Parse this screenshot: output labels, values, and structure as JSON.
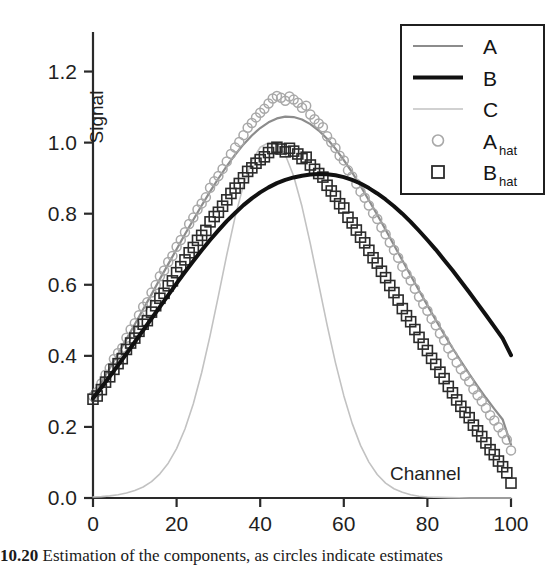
{
  "figure": {
    "caption_number": "10.20",
    "caption_text": "Estimation of the components, as circles indicate estimates"
  },
  "chart_data": {
    "type": "line",
    "title": "",
    "xlabel": "Channel",
    "ylabel": "Signal",
    "xlim": [
      0,
      100
    ],
    "ylim": [
      0,
      1.3
    ],
    "xticks": [
      "0",
      "20",
      "40",
      "60",
      "80",
      "100"
    ],
    "xtick_values": [
      0,
      20,
      40,
      60,
      80,
      100
    ],
    "yticks": [
      "0.0",
      "0.2",
      "0.4",
      "0.6",
      "0.8",
      "1.0",
      "1.2"
    ],
    "ytick_values": [
      0.0,
      0.2,
      0.4,
      0.6,
      0.8,
      1.0,
      1.2
    ],
    "grid": false,
    "legend_position": "top-right",
    "series": [
      {
        "name": "A",
        "label": "A",
        "kind": "line",
        "color": "#8c8c8c",
        "linewidth": 2.2,
        "x": [
          0,
          2,
          4,
          6,
          8,
          10,
          12,
          14,
          16,
          18,
          20,
          22,
          24,
          26,
          28,
          30,
          32,
          34,
          36,
          38,
          40,
          42,
          44,
          46,
          48,
          50,
          52,
          54,
          56,
          58,
          60,
          62,
          64,
          66,
          68,
          70,
          72,
          74,
          76,
          78,
          80,
          82,
          84,
          86,
          88,
          90,
          92,
          94,
          96,
          98,
          100
        ],
        "y": [
          0.285,
          0.325,
          0.365,
          0.405,
          0.447,
          0.489,
          0.531,
          0.573,
          0.616,
          0.658,
          0.7,
          0.742,
          0.783,
          0.823,
          0.862,
          0.899,
          0.934,
          0.966,
          0.995,
          1.02,
          1.041,
          1.057,
          1.068,
          1.073,
          1.072,
          1.065,
          1.052,
          1.034,
          1.011,
          0.983,
          0.951,
          0.916,
          0.878,
          0.838,
          0.797,
          0.755,
          0.712,
          0.669,
          0.626,
          0.584,
          0.542,
          0.501,
          0.461,
          0.422,
          0.385,
          0.349,
          0.315,
          0.282,
          0.251,
          0.221,
          0.15
        ]
      },
      {
        "name": "B",
        "label": "B",
        "kind": "line",
        "color": "#111111",
        "linewidth": 4.0,
        "x": [
          0,
          2,
          4,
          6,
          8,
          10,
          12,
          14,
          16,
          18,
          20,
          22,
          24,
          26,
          28,
          30,
          32,
          34,
          36,
          38,
          40,
          42,
          44,
          46,
          48,
          50,
          52,
          54,
          56,
          58,
          60,
          62,
          64,
          66,
          68,
          70,
          72,
          74,
          76,
          78,
          80,
          82,
          84,
          86,
          88,
          90,
          92,
          94,
          96,
          98,
          100
        ],
        "y": [
          0.28,
          0.311,
          0.342,
          0.374,
          0.406,
          0.439,
          0.472,
          0.505,
          0.538,
          0.571,
          0.604,
          0.636,
          0.667,
          0.697,
          0.726,
          0.753,
          0.779,
          0.802,
          0.824,
          0.843,
          0.86,
          0.874,
          0.886,
          0.895,
          0.902,
          0.907,
          0.91,
          0.912,
          0.911,
          0.908,
          0.903,
          0.895,
          0.885,
          0.872,
          0.857,
          0.84,
          0.821,
          0.8,
          0.777,
          0.752,
          0.726,
          0.699,
          0.67,
          0.641,
          0.61,
          0.579,
          0.547,
          0.515,
          0.482,
          0.449,
          0.402
        ]
      },
      {
        "name": "C",
        "label": "C",
        "kind": "line",
        "color": "#c2c2c2",
        "linewidth": 1.6,
        "x": [
          0,
          2,
          4,
          6,
          8,
          10,
          12,
          14,
          16,
          18,
          20,
          22,
          24,
          26,
          28,
          30,
          32,
          34,
          36,
          38,
          40,
          42,
          44,
          46,
          48,
          50,
          52,
          54,
          56,
          58,
          60,
          62,
          64,
          66,
          68,
          70,
          72,
          74,
          76,
          78,
          80,
          85,
          90,
          95,
          100
        ],
        "y": [
          0.003,
          0.004,
          0.006,
          0.009,
          0.014,
          0.021,
          0.031,
          0.046,
          0.068,
          0.098,
          0.139,
          0.194,
          0.265,
          0.353,
          0.456,
          0.569,
          0.684,
          0.791,
          0.881,
          0.948,
          0.987,
          1.0,
          0.996,
          0.966,
          0.906,
          0.82,
          0.715,
          0.601,
          0.487,
          0.381,
          0.288,
          0.21,
          0.148,
          0.101,
          0.066,
          0.042,
          0.026,
          0.016,
          0.009,
          0.005,
          0.003,
          0.001,
          0.0,
          0.0,
          0.0
        ]
      },
      {
        "name": "A_hat",
        "label": "A",
        "label_sub": "hat",
        "kind": "scatter",
        "marker": "circle",
        "color": "#a8a8a8",
        "markersize": 9,
        "x": [
          0,
          1,
          2,
          3,
          4,
          5,
          6,
          7,
          8,
          9,
          10,
          11,
          12,
          13,
          14,
          15,
          16,
          17,
          18,
          19,
          20,
          21,
          22,
          23,
          24,
          25,
          26,
          27,
          28,
          29,
          30,
          31,
          32,
          33,
          34,
          35,
          36,
          37,
          38,
          39,
          40,
          41,
          42,
          43,
          44,
          45,
          46,
          47,
          48,
          49,
          50,
          51,
          52,
          53,
          54,
          55,
          56,
          57,
          58,
          59,
          60,
          61,
          62,
          63,
          64,
          65,
          66,
          67,
          68,
          69,
          70,
          71,
          72,
          73,
          74,
          75,
          76,
          77,
          78,
          79,
          80,
          81,
          82,
          83,
          84,
          85,
          86,
          87,
          88,
          89,
          90,
          91,
          92,
          93,
          94,
          95,
          96,
          97,
          98,
          99,
          100
        ],
        "y": [
          0.286,
          0.298,
          0.322,
          0.347,
          0.366,
          0.391,
          0.408,
          0.422,
          0.451,
          0.474,
          0.492,
          0.514,
          0.538,
          0.551,
          0.578,
          0.599,
          0.624,
          0.64,
          0.664,
          0.681,
          0.707,
          0.726,
          0.748,
          0.771,
          0.789,
          0.812,
          0.829,
          0.846,
          0.873,
          0.891,
          0.906,
          0.926,
          0.947,
          0.968,
          0.986,
          1.002,
          1.021,
          1.042,
          1.055,
          1.071,
          1.084,
          1.095,
          1.11,
          1.124,
          1.131,
          1.126,
          1.118,
          1.13,
          1.121,
          1.112,
          1.098,
          1.104,
          1.079,
          1.066,
          1.054,
          1.043,
          1.018,
          1.001,
          0.985,
          0.963,
          0.95,
          0.922,
          0.905,
          0.884,
          0.862,
          0.845,
          0.823,
          0.801,
          0.785,
          0.761,
          0.742,
          0.719,
          0.698,
          0.676,
          0.651,
          0.63,
          0.612,
          0.589,
          0.566,
          0.546,
          0.527,
          0.504,
          0.486,
          0.463,
          0.444,
          0.421,
          0.402,
          0.381,
          0.362,
          0.344,
          0.328,
          0.306,
          0.289,
          0.272,
          0.253,
          0.233,
          0.218,
          0.199,
          0.182,
          0.164,
          0.134
        ]
      },
      {
        "name": "B_hat",
        "label": "B",
        "label_sub": "hat",
        "kind": "scatter",
        "marker": "square",
        "color": "#2b2b2b",
        "markersize": 10,
        "x": [
          0,
          1,
          2,
          3,
          4,
          5,
          6,
          7,
          8,
          9,
          10,
          11,
          12,
          13,
          14,
          15,
          16,
          17,
          18,
          19,
          20,
          21,
          22,
          23,
          24,
          25,
          26,
          27,
          28,
          29,
          30,
          31,
          32,
          33,
          34,
          35,
          36,
          37,
          38,
          39,
          40,
          41,
          42,
          43,
          44,
          45,
          46,
          47,
          48,
          49,
          50,
          51,
          52,
          53,
          54,
          55,
          56,
          57,
          58,
          59,
          60,
          61,
          62,
          63,
          64,
          65,
          66,
          67,
          68,
          69,
          70,
          71,
          72,
          73,
          74,
          75,
          76,
          77,
          78,
          79,
          80,
          81,
          82,
          83,
          84,
          85,
          86,
          87,
          88,
          89,
          90,
          91,
          92,
          93,
          94,
          95,
          96,
          97,
          98,
          99,
          100
        ],
        "y": [
          0.278,
          0.287,
          0.305,
          0.326,
          0.341,
          0.362,
          0.378,
          0.392,
          0.418,
          0.436,
          0.45,
          0.469,
          0.489,
          0.499,
          0.523,
          0.541,
          0.562,
          0.576,
          0.597,
          0.611,
          0.634,
          0.651,
          0.67,
          0.69,
          0.705,
          0.725,
          0.739,
          0.753,
          0.777,
          0.792,
          0.804,
          0.821,
          0.839,
          0.857,
          0.872,
          0.885,
          0.901,
          0.919,
          0.929,
          0.942,
          0.952,
          0.96,
          0.972,
          0.983,
          0.987,
          0.982,
          0.974,
          0.984,
          0.976,
          0.968,
          0.955,
          0.959,
          0.937,
          0.925,
          0.913,
          0.903,
          0.88,
          0.864,
          0.849,
          0.828,
          0.816,
          0.79,
          0.774,
          0.754,
          0.734,
          0.718,
          0.697,
          0.676,
          0.661,
          0.638,
          0.62,
          0.598,
          0.578,
          0.557,
          0.533,
          0.513,
          0.496,
          0.474,
          0.452,
          0.433,
          0.415,
          0.393,
          0.376,
          0.354,
          0.336,
          0.314,
          0.296,
          0.276,
          0.258,
          0.241,
          0.226,
          0.205,
          0.189,
          0.173,
          0.155,
          0.136,
          0.122,
          0.104,
          0.088,
          0.071,
          0.042
        ]
      }
    ],
    "legend_entries": [
      {
        "label": "A",
        "sub": "",
        "style": "line-gray"
      },
      {
        "label": "B",
        "sub": "",
        "style": "line-black"
      },
      {
        "label": "C",
        "sub": "",
        "style": "line-light"
      },
      {
        "label": "A",
        "sub": "hat",
        "style": "marker-circle"
      },
      {
        "label": "B",
        "sub": "hat",
        "style": "marker-square"
      }
    ]
  }
}
